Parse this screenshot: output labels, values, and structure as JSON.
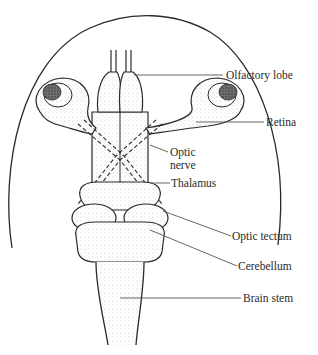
{
  "diagram": {
    "colors": {
      "ink": "#2a2a2a",
      "leader": "#555555",
      "stipple": "#bdbdbd",
      "pupil": "#555555",
      "background": "#ffffff"
    },
    "labels": [
      {
        "id": "olfactory-lobe",
        "text": "Olfactory lobe"
      },
      {
        "id": "retina",
        "text": "Retina"
      },
      {
        "id": "optic-nerve-line1",
        "text": "Optic"
      },
      {
        "id": "optic-nerve-line2",
        "text": "nerve"
      },
      {
        "id": "thalamus",
        "text": "Thalamus"
      },
      {
        "id": "optic-tectum",
        "text": "Optic tectum"
      },
      {
        "id": "cerebellum",
        "text": "Cerebellum"
      },
      {
        "id": "brain-stem",
        "text": "Brain stem"
      }
    ]
  }
}
